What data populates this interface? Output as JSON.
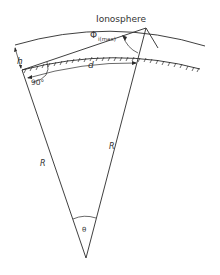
{
  "diagram": {
    "title": "Ionosphere",
    "labels": {
      "ionosphere": "Ionosphere",
      "phi": "Φ",
      "phi_sub": "i(max)",
      "h": "h",
      "d": "d",
      "angle_90": "90°",
      "radius_left": "R",
      "radius_right": "R",
      "theta": "θ"
    },
    "colors": {
      "line": "#2a2a2a",
      "text": "#333333",
      "background": "#ffffff"
    }
  }
}
